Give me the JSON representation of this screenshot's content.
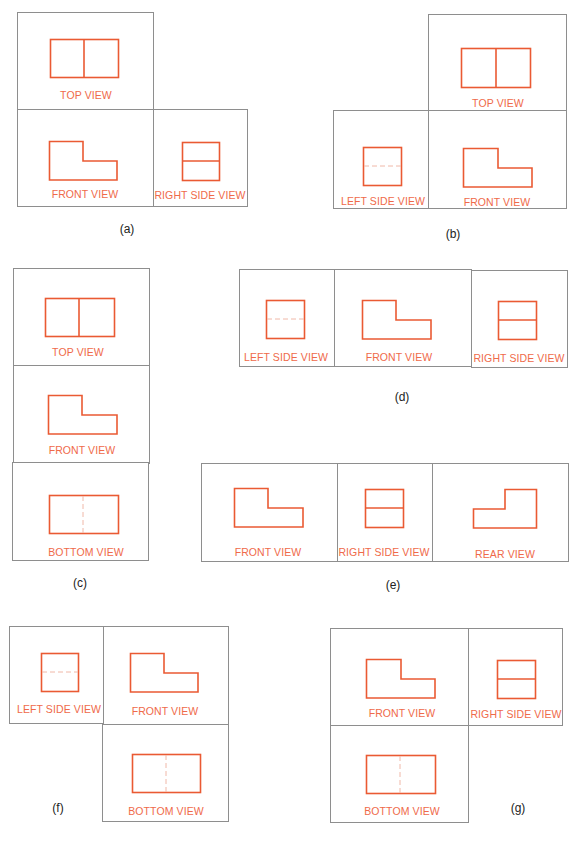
{
  "colors": {
    "outline": "#ea5a33",
    "label": "#ef6a4a",
    "hidden_line": "#f0b8a8",
    "frame": "#8e8e8e",
    "caption": "#222222"
  },
  "figures": [
    {
      "caption": "(a)",
      "views": [
        {
          "label": "TOP VIEW",
          "shape": "split-rectangle-vertical"
        },
        {
          "label": "FRONT VIEW",
          "shape": "l-shape"
        },
        {
          "label": "RIGHT SIDE VIEW",
          "shape": "split-square-horizontal"
        }
      ]
    },
    {
      "caption": "(b)",
      "views": [
        {
          "label": "TOP VIEW",
          "shape": "split-rectangle-vertical"
        },
        {
          "label": "LEFT SIDE VIEW",
          "shape": "square-hidden-horizontal"
        },
        {
          "label": "FRONT VIEW",
          "shape": "l-shape"
        }
      ]
    },
    {
      "caption": "(c)",
      "views": [
        {
          "label": "TOP VIEW",
          "shape": "split-rectangle-vertical"
        },
        {
          "label": "FRONT VIEW",
          "shape": "l-shape"
        },
        {
          "label": "BOTTOM VIEW",
          "shape": "rectangle-hidden-vertical"
        }
      ]
    },
    {
      "caption": "(d)",
      "views": [
        {
          "label": "LEFT SIDE VIEW",
          "shape": "square-hidden-horizontal"
        },
        {
          "label": "FRONT VIEW",
          "shape": "l-shape"
        },
        {
          "label": "RIGHT SIDE VIEW",
          "shape": "split-square-horizontal"
        }
      ]
    },
    {
      "caption": "(e)",
      "views": [
        {
          "label": "FRONT VIEW",
          "shape": "l-shape"
        },
        {
          "label": "RIGHT SIDE VIEW",
          "shape": "split-square-horizontal"
        },
        {
          "label": "REAR VIEW",
          "shape": "l-shape-mirrored"
        }
      ]
    },
    {
      "caption": "(f)",
      "views": [
        {
          "label": "LEFT SIDE VIEW",
          "shape": "square-hidden-horizontal"
        },
        {
          "label": "FRONT VIEW",
          "shape": "l-shape"
        },
        {
          "label": "BOTTOM VIEW",
          "shape": "rectangle-hidden-vertical"
        }
      ]
    },
    {
      "caption": "(g)",
      "views": [
        {
          "label": "FRONT VIEW",
          "shape": "l-shape"
        },
        {
          "label": "RIGHT SIDE VIEW",
          "shape": "split-square-horizontal"
        },
        {
          "label": "BOTTOM VIEW",
          "shape": "rectangle-hidden-vertical"
        }
      ]
    }
  ]
}
